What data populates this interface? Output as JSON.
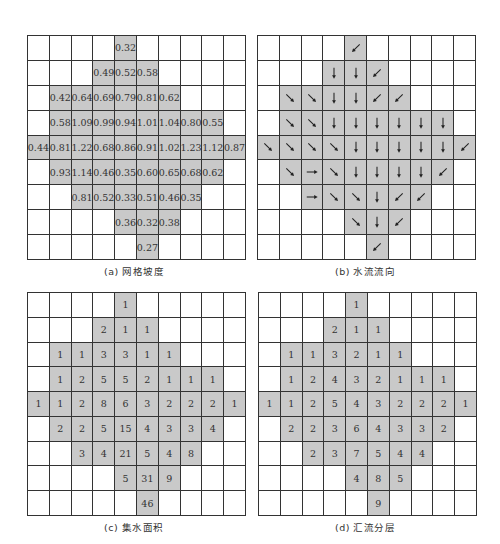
{
  "figure": {
    "panels": [
      {
        "id": "a",
        "caption": "(a) 网格坡度",
        "type": "values",
        "grid": [
          [
            "",
            "",
            "",
            "",
            "0.32",
            "",
            "",
            "",
            "",
            ""
          ],
          [
            "",
            "",
            "",
            "0.49",
            "0.52",
            "0.58",
            "",
            "",
            "",
            ""
          ],
          [
            "",
            "0.42",
            "0.64",
            "0.69",
            "0.79",
            "0.81",
            "0.62",
            "",
            "",
            ""
          ],
          [
            "",
            "0.58",
            "1.09",
            "0.99",
            "0.94",
            "1.01",
            "1.04",
            "0.80",
            "0.55",
            ""
          ],
          [
            "0.44",
            "0.81",
            "1.22",
            "0.68",
            "0.86",
            "0.91",
            "1.02",
            "1.23",
            "1.12",
            "0.87"
          ],
          [
            "",
            "0.93",
            "1.14",
            "0.46",
            "0.35",
            "0.60",
            "0.65",
            "0.68",
            "0.62",
            ""
          ],
          [
            "",
            "",
            "0.81",
            "0.52",
            "0.33",
            "0.51",
            "0.46",
            "0.35",
            "",
            ""
          ],
          [
            "",
            "",
            "",
            "",
            "0.36",
            "0.32",
            "0.38",
            "",
            "",
            ""
          ],
          [
            "",
            "",
            "",
            "",
            "",
            "0.27",
            "",
            "",
            "",
            ""
          ]
        ]
      },
      {
        "id": "b",
        "caption": "(b) 水流流向",
        "type": "arrows",
        "grid": [
          [
            "",
            "",
            "",
            "",
            "SW",
            "",
            "",
            "",
            "",
            ""
          ],
          [
            "",
            "",
            "",
            "S",
            "S",
            "SW",
            "",
            "",
            "",
            ""
          ],
          [
            "",
            "SE",
            "SE",
            "S",
            "S",
            "SW",
            "SW",
            "",
            "",
            ""
          ],
          [
            "",
            "SE",
            "SE",
            "S",
            "S",
            "S",
            "S",
            "S",
            "S",
            ""
          ],
          [
            "SE",
            "SE",
            "SE",
            "SE",
            "S",
            "S",
            "S",
            "S",
            "S",
            "SW"
          ],
          [
            "",
            "SE",
            "E",
            "SE",
            "S",
            "S",
            "S",
            "S",
            "SW",
            ""
          ],
          [
            "",
            "",
            "E",
            "SE",
            "SE",
            "S",
            "SW",
            "SW",
            "",
            ""
          ],
          [
            "",
            "",
            "",
            "",
            "SE",
            "S",
            "SW",
            "",
            "",
            ""
          ],
          [
            "",
            "",
            "",
            "",
            "",
            "SW",
            "",
            "",
            "",
            ""
          ]
        ]
      },
      {
        "id": "c",
        "caption": "(c) 集水面积",
        "type": "values",
        "grid": [
          [
            "",
            "",
            "",
            "",
            "1",
            "",
            "",
            "",
            "",
            ""
          ],
          [
            "",
            "",
            "",
            "2",
            "1",
            "1",
            "",
            "",
            "",
            ""
          ],
          [
            "",
            "1",
            "1",
            "3",
            "3",
            "1",
            "1",
            "",
            "",
            ""
          ],
          [
            "",
            "1",
            "2",
            "5",
            "5",
            "2",
            "1",
            "1",
            "1",
            ""
          ],
          [
            "1",
            "1",
            "2",
            "8",
            "6",
            "3",
            "2",
            "2",
            "2",
            "1"
          ],
          [
            "",
            "2",
            "2",
            "5",
            "15",
            "4",
            "3",
            "3",
            "4",
            ""
          ],
          [
            "",
            "",
            "3",
            "4",
            "21",
            "5",
            "4",
            "8",
            "",
            ""
          ],
          [
            "",
            "",
            "",
            "",
            "5",
            "31",
            "9",
            "",
            "",
            ""
          ],
          [
            "",
            "",
            "",
            "",
            "",
            "46",
            "",
            "",
            "",
            ""
          ]
        ]
      },
      {
        "id": "d",
        "caption": "(d) 汇流分层",
        "type": "values",
        "grid": [
          [
            "",
            "",
            "",
            "",
            "1",
            "",
            "",
            "",
            "",
            ""
          ],
          [
            "",
            "",
            "",
            "2",
            "1",
            "1",
            "",
            "",
            "",
            ""
          ],
          [
            "",
            "1",
            "1",
            "3",
            "2",
            "1",
            "1",
            "",
            "",
            ""
          ],
          [
            "",
            "1",
            "2",
            "4",
            "3",
            "2",
            "1",
            "1",
            "1",
            ""
          ],
          [
            "1",
            "1",
            "2",
            "5",
            "4",
            "3",
            "2",
            "2",
            "2",
            "1"
          ],
          [
            "",
            "2",
            "2",
            "3",
            "6",
            "4",
            "3",
            "3",
            "2",
            ""
          ],
          [
            "",
            "",
            "2",
            "3",
            "7",
            "5",
            "4",
            "4",
            "",
            ""
          ],
          [
            "",
            "",
            "",
            "",
            "4",
            "8",
            "5",
            "",
            "",
            ""
          ],
          [
            "",
            "",
            "",
            "",
            "",
            "9",
            "",
            "",
            "",
            ""
          ]
        ]
      }
    ],
    "mask": [
      [
        0,
        0,
        0,
        0,
        1,
        0,
        0,
        0,
        0,
        0
      ],
      [
        0,
        0,
        0,
        1,
        1,
        1,
        0,
        0,
        0,
        0
      ],
      [
        0,
        1,
        1,
        1,
        1,
        1,
        1,
        0,
        0,
        0
      ],
      [
        0,
        1,
        1,
        1,
        1,
        1,
        1,
        1,
        1,
        0
      ],
      [
        1,
        1,
        1,
        1,
        1,
        1,
        1,
        1,
        1,
        1
      ],
      [
        0,
        1,
        1,
        1,
        1,
        1,
        1,
        1,
        1,
        0
      ],
      [
        0,
        0,
        1,
        1,
        1,
        1,
        1,
        1,
        0,
        0
      ],
      [
        0,
        0,
        0,
        0,
        1,
        1,
        1,
        0,
        0,
        0
      ],
      [
        0,
        0,
        0,
        0,
        0,
        1,
        0,
        0,
        0,
        0
      ]
    ],
    "colors": {
      "shaded": "#c9c9c9",
      "grid_line": "#333333",
      "background": "#ffffff"
    },
    "arrow_legend": {
      "S": "↓",
      "SW": "↙",
      "SE": "↘",
      "E": "→"
    }
  }
}
